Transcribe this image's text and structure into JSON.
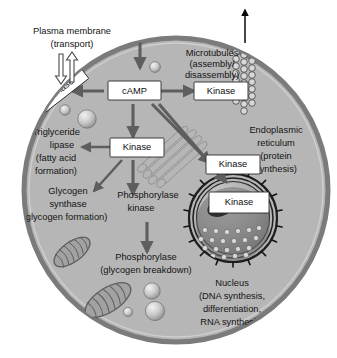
{
  "figure": {
    "type": "cell-signaling-diagram",
    "background_color": "#ffffff",
    "cell_fill": "#b6b6b6",
    "cell_membrane_color": "#7b7b7b",
    "arrow_color": "#5e5e5e",
    "box_fill": "#ffffff",
    "box_border": "#2b2b2b"
  },
  "external_labels": {
    "plasma_membrane": {
      "line1": "Plasma membrane",
      "line2": "(transport)"
    },
    "export_arrow_icon": "up-arrow"
  },
  "boxes": {
    "camp": "cAMP",
    "kinase_membrane": "Kinase",
    "kinase_microtubules": "Kinase",
    "kinase_lipase": "Kinase",
    "kinase_er": "Kinase",
    "kinase_nucleus": "Kinase"
  },
  "pathways": [
    {
      "id": "microtubules",
      "lines": [
        "Microtubules",
        "(assembly/",
        "disassembly)"
      ]
    },
    {
      "id": "triglyceride-lipase",
      "lines": [
        "Triglyceride",
        "lipase",
        "(fatty acid",
        "formation)"
      ]
    },
    {
      "id": "glycogen-synthase",
      "lines": [
        "Glycogen",
        "synthase",
        "(glycogen formation)"
      ]
    },
    {
      "id": "phosphorylase-kinase",
      "lines": [
        "Phosphorylase",
        "kinase"
      ]
    },
    {
      "id": "phosphorylase",
      "lines": [
        "Phosphorylase",
        "(glycogen breakdown)"
      ]
    },
    {
      "id": "endoplasmic-reticulum",
      "lines": [
        "Endoplasmic",
        "reticulum",
        "(protein",
        "synthesis)"
      ]
    },
    {
      "id": "nucleus",
      "lines": [
        "Nucleus",
        "(DNA synthesis,",
        "differentiation,",
        "RNA synthesis)"
      ]
    }
  ],
  "organelles": [
    {
      "name": "mitochondrion-upper",
      "count": 1
    },
    {
      "name": "mitochondrion-lower",
      "count": 1
    },
    {
      "name": "nucleus-organelle",
      "count": 1
    },
    {
      "name": "golgi-er-stack",
      "count": 1
    },
    {
      "name": "microtubule-bundle",
      "count": 3
    },
    {
      "name": "vesicle",
      "count": 6
    }
  ]
}
